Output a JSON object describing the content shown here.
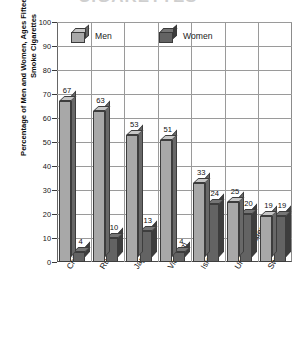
{
  "title_remnant": "CIGARETTES",
  "axis": {
    "y_title": "Percentage of Men and Women, Ages Fifteen and Older, Who Smoke Cigarettes",
    "y_ticks": [
      "0",
      "10",
      "20",
      "30",
      "40",
      "50",
      "60",
      "70",
      "80",
      "90",
      "100"
    ]
  },
  "legend": {
    "men_label": "Men",
    "women_label": "Women",
    "men_color": "#a8a8a8",
    "women_color": "#636363"
  },
  "chart_data": {
    "type": "bar",
    "title": "",
    "xlabel": "",
    "ylabel": "Percentage of Men and Women, Ages Fifteen and Older, Who Smoke Cigarettes",
    "ylim": [
      0,
      100
    ],
    "ytick_step": 10,
    "grid": true,
    "legend_position": "top-left-inside",
    "categories": [
      "China",
      "Russia",
      "Japan",
      "Vietnam",
      "Israel",
      "United States",
      "Sweden"
    ],
    "series": [
      {
        "name": "Men",
        "color": "#a8a8a8",
        "values": [
          67,
          63,
          53,
          51,
          33,
          25,
          19
        ]
      },
      {
        "name": "Women",
        "color": "#636363",
        "values": [
          4,
          10,
          13,
          4,
          24,
          20,
          19
        ]
      }
    ]
  }
}
